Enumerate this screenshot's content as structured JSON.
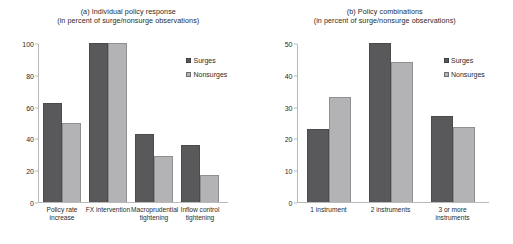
{
  "chart_data": [
    {
      "type": "bar",
      "panel": "a",
      "title": "(a) Individual policy response",
      "subtitle": "(in percent of surge/nonsurge observations)",
      "xlabel": "",
      "ylabel": "",
      "ylim": [
        0,
        100
      ],
      "yticks": [
        0,
        20,
        40,
        60,
        80,
        100
      ],
      "grid": false,
      "legend_position": "right",
      "categories": [
        "Policy rate increase",
        "FX intervention",
        "Macroprudential tightening",
        "Inflow control tightening"
      ],
      "category_lines": [
        [
          "Policy rate",
          "increase"
        ],
        [
          "FX intervention"
        ],
        [
          "Macroprudential",
          "tightening"
        ],
        [
          "Inflow control",
          "tightening"
        ]
      ],
      "series": [
        {
          "name": "Surges",
          "color": "#59595b",
          "values": [
            62,
            100,
            43,
            36
          ]
        },
        {
          "name": "Nonsurges",
          "color": "#b3b3b5",
          "values": [
            49.5,
            100,
            29,
            17
          ]
        }
      ]
    },
    {
      "type": "bar",
      "panel": "b",
      "title": "(b) Policy combinations",
      "subtitle": "(in percent of surge/nonsurge observations)",
      "xlabel": "",
      "ylabel": "",
      "ylim": [
        0,
        50
      ],
      "yticks": [
        0,
        10,
        20,
        30,
        40,
        50
      ],
      "grid": false,
      "legend_position": "right",
      "categories": [
        "1 instrument",
        "2 instruments",
        "3 or more instruments"
      ],
      "category_lines": [
        [
          "1 instrument"
        ],
        [
          "2 instruments"
        ],
        [
          "3 or more instruments"
        ]
      ],
      "series": [
        {
          "name": "Surges",
          "color": "#59595b",
          "values": [
            23,
            50,
            27
          ]
        },
        {
          "name": "Nonsurges",
          "color": "#b3b3b5",
          "values": [
            33,
            44,
            23.5
          ]
        }
      ]
    }
  ],
  "panelA": {
    "title": "(a) Individual policy response",
    "subtitle": "(in percent of surge/nonsurge observations)",
    "legend": {
      "surges": "Surges",
      "nonsurges": "Nonsurges"
    }
  },
  "panelB": {
    "title": "(b) Policy combinations",
    "subtitle": "(in percent of surge/nonsurge observations)",
    "legend": {
      "surges": "Surges",
      "nonsurges": "Nonsurges"
    }
  }
}
